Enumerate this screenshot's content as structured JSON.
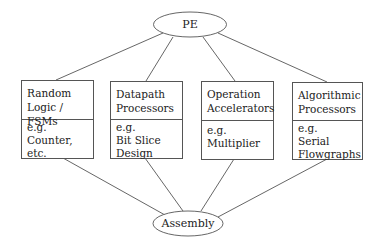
{
  "diagram": {
    "top_node": {
      "label": "PE"
    },
    "bottom_node": {
      "label": "Assembly"
    },
    "categories": [
      {
        "title_line1": "Random",
        "title_line2": "Logic / FSMs",
        "examples": [
          "e.g.",
          "Counter,",
          "etc."
        ]
      },
      {
        "title_line1": "Datapath",
        "title_line2": "Processors",
        "examples": [
          "e.g.",
          "Bit Slice",
          "Design"
        ]
      },
      {
        "title_line1": "Operation",
        "title_line2": "Accelerators",
        "examples": [
          "e.g.",
          "Multiplier"
        ]
      },
      {
        "title_line1": "Algorithmic",
        "title_line2": "Processors",
        "examples": [
          "e.g.",
          "Serial",
          "Flowgraphs"
        ]
      }
    ],
    "edges": [
      [
        "PE",
        "Random Logic / FSMs"
      ],
      [
        "PE",
        "Datapath Processors"
      ],
      [
        "PE",
        "Operation Accelerators"
      ],
      [
        "PE",
        "Algorithmic Processors"
      ],
      [
        "Random Logic / FSMs",
        "Assembly"
      ],
      [
        "Datapath Processors",
        "Assembly"
      ],
      [
        "Operation Accelerators",
        "Assembly"
      ],
      [
        "Algorithmic Processors",
        "Assembly"
      ]
    ]
  }
}
